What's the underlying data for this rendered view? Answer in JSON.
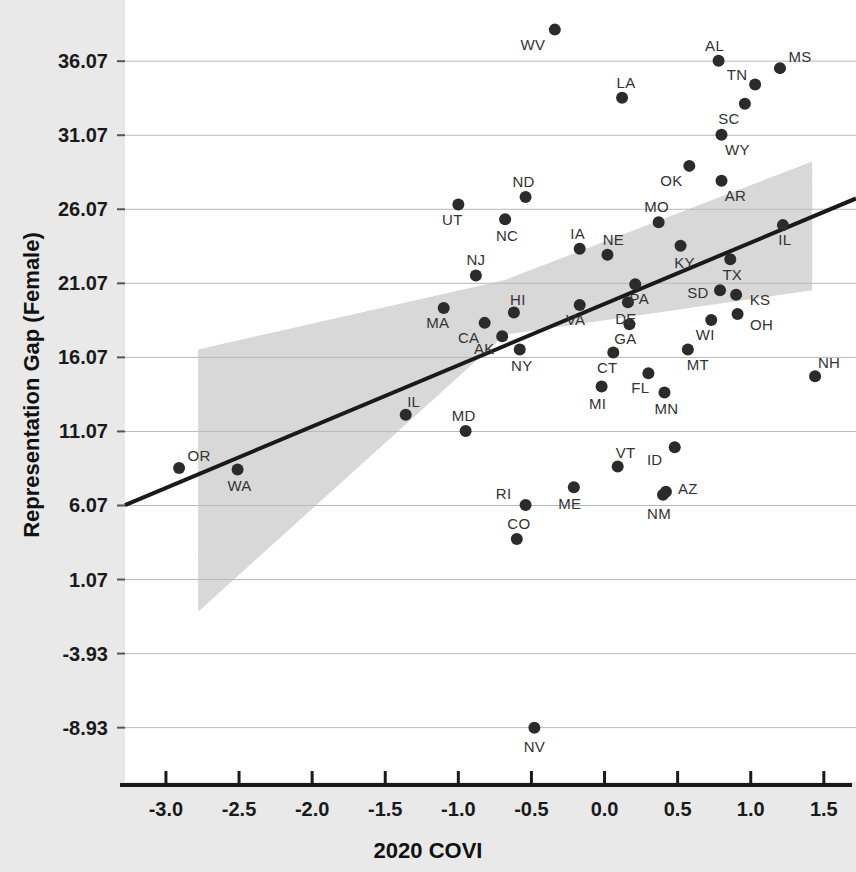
{
  "chart_data": {
    "type": "scatter",
    "title": "",
    "xlabel": "2020 COVI",
    "ylabel": "Representation Gap (Female)",
    "xlim": [
      -3.28,
      1.72
    ],
    "ylim": [
      -12.6,
      40.2
    ],
    "xticks": [
      "-3.0",
      "-2.5",
      "-2.0",
      "-1.5",
      "-1.0",
      "-0.5",
      "0.0",
      "0.5",
      "1.0",
      "1.5"
    ],
    "xtick_values": [
      -3.0,
      -2.5,
      -2.0,
      -1.5,
      -1.0,
      -0.5,
      0.0,
      0.5,
      1.0,
      1.5
    ],
    "yticks": [
      "36.07",
      "31.07",
      "26.07",
      "21.07",
      "16.07",
      "11.07",
      "6.07",
      "1.07",
      "-3.93",
      "-8.93"
    ],
    "ytick_values": [
      36.07,
      31.07,
      26.07,
      21.07,
      16.07,
      11.07,
      6.07,
      1.07,
      -3.93,
      -8.93
    ],
    "grid": true,
    "legend": "none",
    "point_label_field": "state",
    "fit_line": {
      "type": "linear-regression",
      "x_start": -3.28,
      "y_start": 6.1,
      "x_end": 1.72,
      "y_end": 26.8,
      "color": "#1a1a1a"
    },
    "confidence_band": {
      "label": "95% confidence interval",
      "color": "#c9c9c9",
      "x_start": -2.78,
      "x_end": 1.42,
      "lower_start": -1.1,
      "upper_start": 16.6,
      "lower_mid": 17.6,
      "upper_mid": 21.3,
      "lower_end": 20.6,
      "upper_end": 29.3
    },
    "points": [
      {
        "state": "WV",
        "x": -0.34,
        "y": 38.2,
        "label_dx": -22,
        "label_dy": 14
      },
      {
        "state": "AL",
        "x": 0.78,
        "y": 36.1,
        "label_dx": -4,
        "label_dy": -16
      },
      {
        "state": "MS",
        "x": 1.2,
        "y": 35.6,
        "label_dx": 20,
        "label_dy": -12
      },
      {
        "state": "TN",
        "x": 1.03,
        "y": 34.5,
        "label_dx": -18,
        "label_dy": -10
      },
      {
        "state": "LA",
        "x": 0.12,
        "y": 33.6,
        "label_dx": 4,
        "label_dy": -16
      },
      {
        "state": "SC",
        "x": 0.96,
        "y": 33.2,
        "label_dx": -16,
        "label_dy": 14
      },
      {
        "state": "WY",
        "x": 0.8,
        "y": 31.1,
        "label_dx": 16,
        "label_dy": 14
      },
      {
        "state": "OK",
        "x": 0.58,
        "y": 29.0,
        "label_dx": -18,
        "label_dy": 14
      },
      {
        "state": "AR",
        "x": 0.8,
        "y": 28.0,
        "label_dx": 14,
        "label_dy": 14
      },
      {
        "state": "ND",
        "x": -0.54,
        "y": 26.9,
        "label_dx": -2,
        "label_dy": -16
      },
      {
        "state": "UT",
        "x": -1.0,
        "y": 26.4,
        "label_dx": -6,
        "label_dy": 15
      },
      {
        "state": "NC",
        "x": -0.68,
        "y": 25.4,
        "label_dx": 2,
        "label_dy": 16
      },
      {
        "state": "MO",
        "x": 0.37,
        "y": 25.2,
        "label_dx": -2,
        "label_dy": -16
      },
      {
        "state": "IL",
        "x": 1.22,
        "y": 25.0,
        "label_dx": 2,
        "label_dy": 14
      },
      {
        "state": "KY",
        "x": 0.52,
        "y": 23.6,
        "label_dx": 4,
        "label_dy": 16
      },
      {
        "state": "IA",
        "x": -0.17,
        "y": 23.4,
        "label_dx": -2,
        "label_dy": -16
      },
      {
        "state": "NE",
        "x": 0.02,
        "y": 23.0,
        "label_dx": 6,
        "label_dy": -16
      },
      {
        "state": "TX",
        "x": 0.86,
        "y": 22.7,
        "label_dx": 2,
        "label_dy": 15
      },
      {
        "state": "NJ",
        "x": -0.88,
        "y": 21.6,
        "label_dx": 0,
        "label_dy": -16
      },
      {
        "state": "PA",
        "x": 0.21,
        "y": 21.0,
        "label_dx": 4,
        "label_dy": 14
      },
      {
        "state": "SD",
        "x": 0.79,
        "y": 20.6,
        "label_dx": -22,
        "label_dy": 2
      },
      {
        "state": "KS",
        "x": 0.9,
        "y": 20.3,
        "label_dx": 24,
        "label_dy": 4
      },
      {
        "state": "DE",
        "x": 0.16,
        "y": 19.8,
        "label_dx": -2,
        "label_dy": 16
      },
      {
        "state": "MA",
        "x": -1.1,
        "y": 19.4,
        "label_dx": -6,
        "label_dy": 14
      },
      {
        "state": "VA",
        "x": -0.17,
        "y": 19.6,
        "label_dx": -4,
        "label_dy": 14
      },
      {
        "state": "HI",
        "x": -0.62,
        "y": 19.1,
        "label_dx": 4,
        "label_dy": -14
      },
      {
        "state": "OH",
        "x": 0.91,
        "y": 19.0,
        "label_dx": 24,
        "label_dy": 10
      },
      {
        "state": "CA",
        "x": -0.82,
        "y": 18.4,
        "label_dx": -16,
        "label_dy": 14
      },
      {
        "state": "WI",
        "x": 0.73,
        "y": 18.6,
        "label_dx": -6,
        "label_dy": 14
      },
      {
        "state": "GA",
        "x": 0.17,
        "y": 18.3,
        "label_dx": -4,
        "label_dy": 14
      },
      {
        "state": "AK",
        "x": -0.7,
        "y": 17.5,
        "label_dx": -18,
        "label_dy": 12
      },
      {
        "state": "NY",
        "x": -0.58,
        "y": 16.6,
        "label_dx": 2,
        "label_dy": 15
      },
      {
        "state": "MT",
        "x": 0.57,
        "y": 16.6,
        "label_dx": 10,
        "label_dy": 14
      },
      {
        "state": "CT",
        "x": 0.06,
        "y": 16.4,
        "label_dx": -6,
        "label_dy": 15
      },
      {
        "state": "NH",
        "x": 1.44,
        "y": 14.8,
        "label_dx": 14,
        "label_dy": -14
      },
      {
        "state": "FL",
        "x": 0.3,
        "y": 15.0,
        "label_dx": -8,
        "label_dy": 14
      },
      {
        "state": "MI",
        "x": -0.02,
        "y": 14.1,
        "label_dx": -4,
        "label_dy": 16
      },
      {
        "state": "MN",
        "x": 0.41,
        "y": 13.7,
        "label_dx": 2,
        "label_dy": 16
      },
      {
        "state": "IL",
        "x": -1.36,
        "y": 12.2,
        "label_dx": 8,
        "label_dy": -14
      },
      {
        "state": "MD",
        "x": -0.95,
        "y": 11.1,
        "label_dx": -2,
        "label_dy": -16
      },
      {
        "state": "ID",
        "x": 0.48,
        "y": 10.0,
        "label_dx": -20,
        "label_dy": 12
      },
      {
        "state": "OR",
        "x": -2.91,
        "y": 8.6,
        "label_dx": 20,
        "label_dy": -13
      },
      {
        "state": "WA",
        "x": -2.51,
        "y": 8.5,
        "label_dx": 2,
        "label_dy": 16
      },
      {
        "state": "VT",
        "x": 0.09,
        "y": 8.7,
        "label_dx": 8,
        "label_dy": -15
      },
      {
        "state": "AZ",
        "x": 0.42,
        "y": 7.0,
        "label_dx": 22,
        "label_dy": -4
      },
      {
        "state": "NM",
        "x": 0.4,
        "y": 6.8,
        "label_dx": -4,
        "label_dy": 18
      },
      {
        "state": "ME",
        "x": -0.21,
        "y": 7.3,
        "label_dx": -4,
        "label_dy": 16
      },
      {
        "state": "RI",
        "x": -0.54,
        "y": 6.1,
        "label_dx": -22,
        "label_dy": -12
      },
      {
        "state": "CO",
        "x": -0.6,
        "y": 3.8,
        "label_dx": 2,
        "label_dy": -16
      },
      {
        "state": "NV",
        "x": -0.48,
        "y": -8.93,
        "label_dx": 0,
        "label_dy": 18
      }
    ]
  }
}
